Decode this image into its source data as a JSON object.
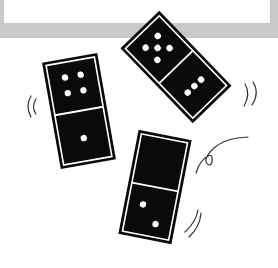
{
  "illustration": {
    "subject": "falling dominoes",
    "colors": {
      "tile": "#0a0a0a",
      "outline": "#ffffff",
      "pip": "#ffffff",
      "band": "#c9c9c9",
      "motion_lines": "#333333"
    },
    "dominoes": [
      {
        "name": "left",
        "top_pips": 4,
        "bottom_pips": 1
      },
      {
        "name": "top-right",
        "top_pips": 5,
        "bottom_pips": 3
      },
      {
        "name": "bottom",
        "top_pips": 0,
        "bottom_pips": 2
      }
    ]
  }
}
